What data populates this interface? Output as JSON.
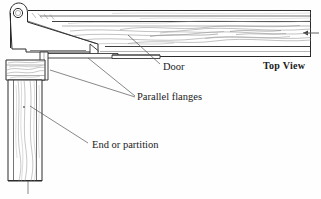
{
  "figure": {
    "title_note": "Top View",
    "view_label": "Top View",
    "background_color": "#ffffff",
    "line_color": "#1a1a1a",
    "grain_color": "#8d8d8d",
    "leader_color": "#555555"
  },
  "labels": {
    "door": "Door",
    "parallel_flanges": "Parallel flanges",
    "end_or_partition": "End or partition",
    "top_view": "Top View"
  },
  "parts": {
    "pivot_hole": "screw-hole",
    "hinge_arm": "tapered-hinge-plate",
    "door_panel": "door-board",
    "post": "end-or-partition-post",
    "upper_flange": "upper-parallel-flange",
    "lower_flange": "lower-parallel-flange"
  },
  "geometry": {
    "pivot_center": [
      18,
      13
    ],
    "pivot_radius": 4.6,
    "door_top_y": 10,
    "door_bottom_y": 57,
    "door_right_x": 311,
    "post_left_x": 6,
    "post_right_x": 45,
    "post_bottom_y": 181
  }
}
